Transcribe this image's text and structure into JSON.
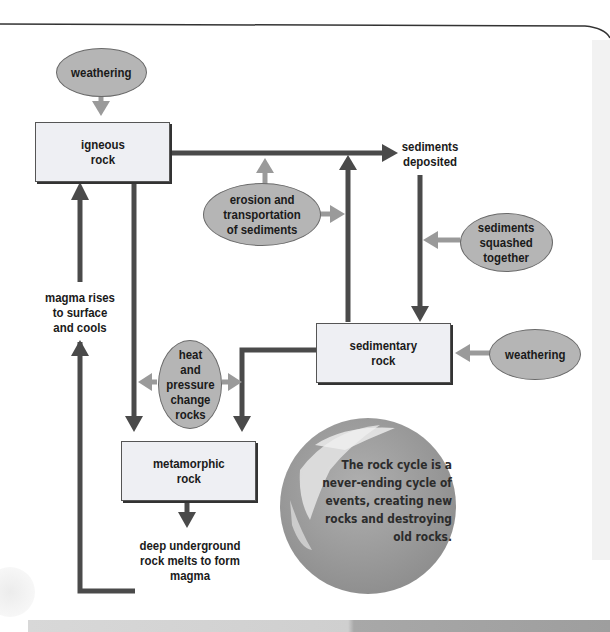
{
  "diagram": {
    "title": "Rock cycle",
    "nodes": {
      "igneous": {
        "line1": "igneous",
        "line2": "rock"
      },
      "sedimentary": {
        "line1": "sedimentary",
        "line2": "rock"
      },
      "metamorphic": {
        "line1": "metamorphic",
        "line2": "rock"
      }
    },
    "processes": {
      "weathering_top": "weathering",
      "erosion": [
        "erosion and",
        "transportation",
        "of sediments"
      ],
      "squashed": [
        "sediments",
        "squashed",
        "together"
      ],
      "weathering_right": "weathering",
      "heat": [
        "heat",
        "and",
        "pressure",
        "change",
        "rocks"
      ]
    },
    "labels": {
      "deposited": [
        "sediments",
        "deposited"
      ],
      "magma_rises": [
        "magma rises",
        "to surface",
        "and cools"
      ],
      "deep_melts": [
        "deep underground",
        "rock melts to form",
        "magma"
      ]
    },
    "globe_caption": [
      "The rock cycle is a",
      "never-ending cycle of",
      "events, creating new",
      "rocks and destroying",
      "old rocks."
    ],
    "colors": {
      "dark_arrow": "#4a4a4a",
      "light_arrow": "#9a9a9a",
      "oval_fill": "#b5b5b5",
      "box_fill": "#eeeff3",
      "globe": "#9c9c9c"
    }
  }
}
